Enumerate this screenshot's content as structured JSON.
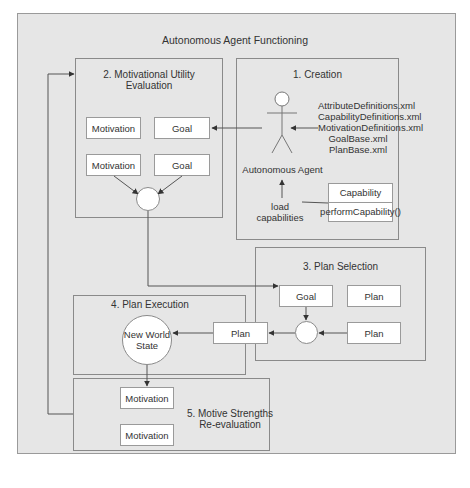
{
  "diagram": {
    "title": "Autonomous Agent Functioning",
    "panels": {
      "creation": {
        "title": "1. Creation",
        "actor_label": "Autonomous Agent",
        "files": [
          "AttributeDefinitions.xml",
          "CapabilityDefinitions.xml",
          "MotivationDefinitions.xml",
          "GoalBase.xml",
          "PlanBase.xml"
        ],
        "load_label_1": "load",
        "load_label_2": "capabilities",
        "capability_class": {
          "name": "Capability",
          "method": "performCapability()"
        }
      },
      "motivational_utility": {
        "title_1": "2. Motivational Utility",
        "title_2": "Evaluation",
        "boxes": [
          "Motivation",
          "Goal",
          "Motivation",
          "Goal"
        ]
      },
      "plan_selection": {
        "title": "3. Plan Selection",
        "boxes": [
          "Goal",
          "Plan",
          "Plan"
        ]
      },
      "plan_execution": {
        "title": "4. Plan Execution",
        "state_1": "New World",
        "state_2": "State",
        "plan_box": "Plan"
      },
      "motive_reevaluation": {
        "title_1": "5. Motive Strengths",
        "title_2": "Re-evaluation",
        "boxes": [
          "Motivation",
          "Motivation"
        ]
      }
    }
  }
}
